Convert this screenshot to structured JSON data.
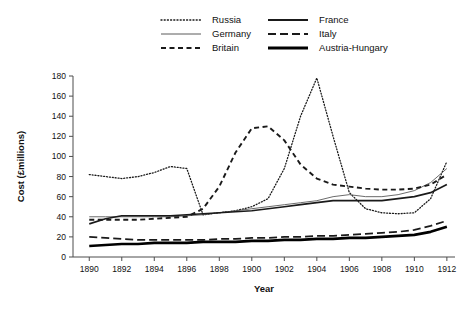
{
  "chart_data": {
    "type": "line",
    "title": "",
    "xlabel": "Year",
    "ylabel": "Cost (£millions)",
    "xlim": [
      1889,
      1912.5
    ],
    "ylim": [
      0,
      180
    ],
    "ytick_values": [
      0,
      20,
      40,
      60,
      80,
      100,
      120,
      140,
      160,
      180
    ],
    "ytick_labels": [
      "0",
      "20",
      "40",
      "60",
      "80",
      "100",
      "120",
      "140",
      "160",
      "180"
    ],
    "xtick_values": [
      1890,
      1892,
      1894,
      1896,
      1898,
      1900,
      1902,
      1904,
      1906,
      1908,
      1910,
      1912
    ],
    "xtick_labels": [
      "1890",
      "1892",
      "1894",
      "1896",
      "1898",
      "1900",
      "1902",
      "1904",
      "1906",
      "1908",
      "1910",
      "1912"
    ],
    "grid": false,
    "legend_position": "top-center",
    "x": [
      1890,
      1891,
      1892,
      1893,
      1894,
      1895,
      1896,
      1897,
      1898,
      1899,
      1900,
      1901,
      1902,
      1903,
      1904,
      1905,
      1906,
      1907,
      1908,
      1909,
      1910,
      1911,
      1912
    ],
    "series": [
      {
        "name": "Russia",
        "style": "dotted",
        "width": 1.3,
        "color": "#1a1a1a",
        "values": [
          82,
          80,
          78,
          80,
          84,
          90,
          88,
          42,
          44,
          46,
          50,
          58,
          88,
          140,
          178,
          120,
          64,
          48,
          44,
          43,
          44,
          58,
          95
        ]
      },
      {
        "name": "Germany",
        "style": "solid-thin",
        "width": 0.9,
        "color": "#5a5a5a",
        "values": [
          40,
          40,
          40,
          40,
          40,
          40,
          41,
          42,
          44,
          46,
          48,
          50,
          52,
          54,
          56,
          60,
          62,
          60,
          60,
          62,
          66,
          74,
          88
        ]
      },
      {
        "name": "Britain",
        "style": "dashed",
        "width": 1.9,
        "color": "#1a1a1a",
        "values": [
          37,
          37,
          37,
          37,
          38,
          39,
          40,
          48,
          70,
          104,
          128,
          130,
          116,
          92,
          78,
          72,
          70,
          68,
          67,
          67,
          68,
          72,
          82
        ]
      },
      {
        "name": "France",
        "style": "solid",
        "width": 1.7,
        "color": "#1a1a1a",
        "values": [
          33,
          38,
          41,
          41,
          41,
          41,
          42,
          43,
          44,
          45,
          46,
          48,
          50,
          52,
          54,
          56,
          56,
          56,
          56,
          58,
          60,
          64,
          72
        ]
      },
      {
        "name": "Italy",
        "style": "longdash",
        "width": 1.7,
        "color": "#1a1a1a",
        "values": [
          20,
          19,
          18,
          17,
          17,
          17,
          17,
          17,
          18,
          18,
          19,
          19,
          20,
          20,
          21,
          21,
          22,
          23,
          24,
          25,
          27,
          31,
          36
        ]
      },
      {
        "name": "Austria-Hungary",
        "style": "solid-thick",
        "width": 2.6,
        "color": "#000000",
        "values": [
          11,
          12,
          13,
          13,
          14,
          14,
          14,
          15,
          15,
          15,
          16,
          16,
          17,
          17,
          18,
          18,
          19,
          19,
          20,
          21,
          22,
          25,
          30
        ]
      }
    ]
  },
  "legend": {
    "entries": [
      {
        "label": "Russia",
        "style": "dotted"
      },
      {
        "label": "France",
        "style": "solid"
      },
      {
        "label": "Germany",
        "style": "solid-thin"
      },
      {
        "label": "Italy",
        "style": "longdash"
      },
      {
        "label": "Britain",
        "style": "dashed"
      },
      {
        "label": "Austria-Hungary",
        "style": "solid-thick"
      }
    ]
  }
}
